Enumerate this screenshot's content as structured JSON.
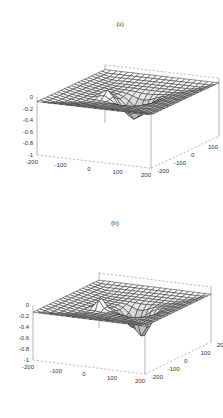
{
  "figure": {
    "top_caption": ""
  },
  "chart_data": [
    {
      "type": "surface3d",
      "title": "(a)",
      "xlabel": "",
      "ylabel": "",
      "zlabel": "",
      "x_ticks": [
        "-200",
        "-100",
        "0",
        "100",
        "200"
      ],
      "y_ticks": [
        "-200",
        "-100",
        "0",
        "100",
        "200"
      ],
      "z_ticks": [
        "0",
        "-0.2",
        "-0.4",
        "-0.6",
        "-0.8",
        "-1"
      ],
      "xlim": [
        -200,
        200
      ],
      "ylim": [
        -200,
        200
      ],
      "zlim": [
        -1,
        0
      ],
      "grid": true,
      "grid_resolution": 20,
      "features": [
        {
          "kind": "peak",
          "x": -60,
          "y": -20,
          "amplitude": 0.15,
          "width": 25
        },
        {
          "kind": "dip",
          "x": 20,
          "y": 10,
          "amplitude": -0.35,
          "width": 45
        }
      ],
      "baseline": -0.2
    },
    {
      "type": "surface3d",
      "title": "(b)",
      "xlabel": "",
      "ylabel": "",
      "zlabel": "",
      "x_ticks": [
        "-200",
        "-100",
        "0",
        "100",
        "200"
      ],
      "y_ticks": [
        "-200",
        "-100",
        "0",
        "100",
        "200"
      ],
      "z_ticks": [
        "0",
        "-0.2",
        "-0.4",
        "-0.6",
        "-0.8",
        "-1"
      ],
      "xlim": [
        -200,
        200
      ],
      "ylim": [
        -200,
        200
      ],
      "zlim": [
        -1,
        0
      ],
      "grid": true,
      "grid_resolution": 20,
      "features": [
        {
          "kind": "peak",
          "x": -60,
          "y": -30,
          "amplitude": 0.25,
          "width": 18
        },
        {
          "kind": "dip",
          "x": 30,
          "y": 20,
          "amplitude": -0.35,
          "width": 35
        },
        {
          "kind": "dip",
          "x": 80,
          "y": -10,
          "amplitude": -0.45,
          "width": 30
        }
      ],
      "baseline": -0.25
    }
  ]
}
